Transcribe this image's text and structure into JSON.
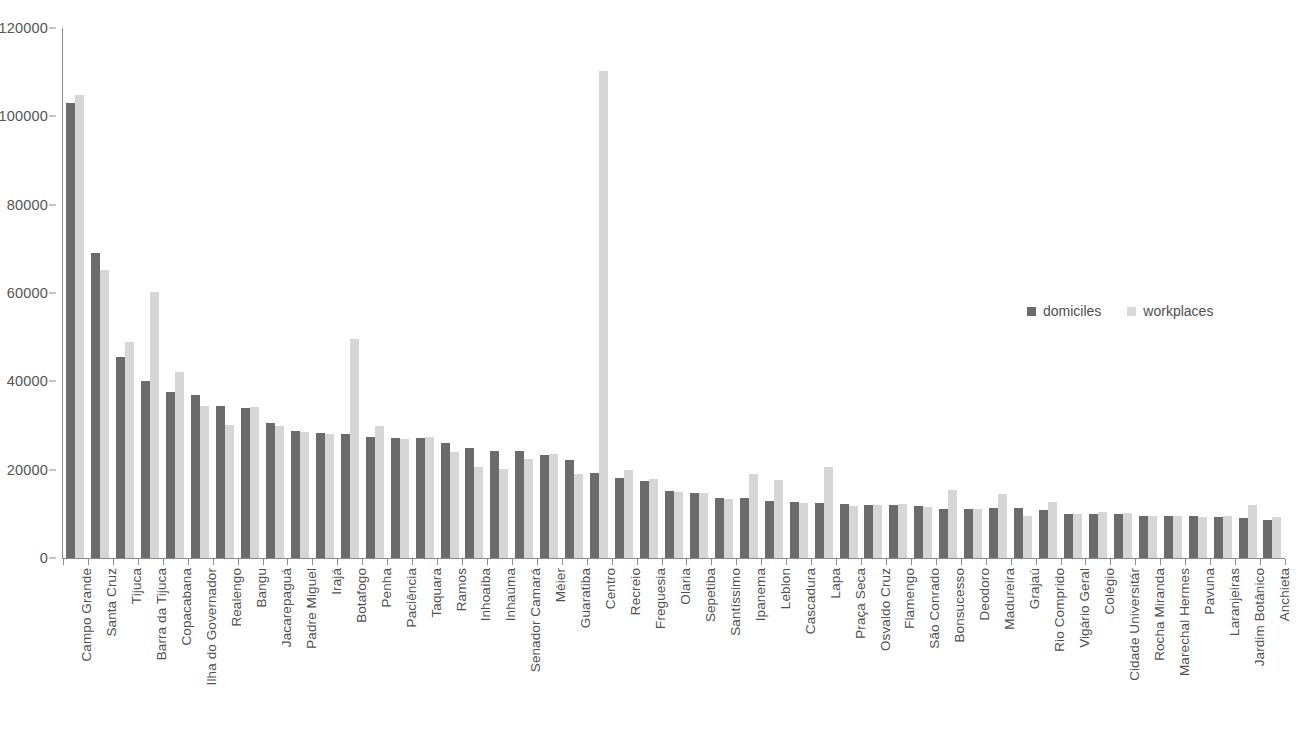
{
  "chart_data": {
    "type": "bar",
    "title": "",
    "subtitle": "",
    "xlabel": "",
    "ylabel": "",
    "ylim": [
      0,
      120000
    ],
    "ytick_step": 20000,
    "ytick_labels": [
      "0",
      "20000",
      "40000",
      "60000",
      "80000",
      "100000",
      "120000"
    ],
    "ytick_values": [
      0,
      20000,
      40000,
      60000,
      80000,
      100000,
      120000
    ],
    "grid": false,
    "legend_position": "inside-right",
    "orientation": "vertical",
    "bar_mode": "grouped",
    "colors": {
      "domiciles": "#6b6b6b",
      "workplaces": "#d6d6d6",
      "axis": "#8a8a8a",
      "text": "#4f4f4f",
      "background": "#ffffff"
    },
    "categories": [
      "Campo Grande",
      "Santa Cruz",
      "Tijuca",
      "Barra da Tijuca",
      "Copacabana",
      "Ilha do Governador",
      "Realengo",
      "Bangu",
      "Jacarepaguá",
      "Padre Miguel",
      "Irajá",
      "Botafogo",
      "Penha",
      "Paciência",
      "Taquara",
      "Ramos",
      "Inhoaíba",
      "Inhaúma",
      "Senador Camará",
      "Méier",
      "Guaratiba",
      "Centro",
      "Recreio",
      "Freguesia",
      "Olaria",
      "Sepetiba",
      "Santíssimo",
      "Ipanema",
      "Leblon",
      "Cascadura",
      "Lapa",
      "Praça Seca",
      "Osvaldo Cruz",
      "Flamengo",
      "São Conrado",
      "Bonsucesso",
      "Deodoro",
      "Madureira",
      "Grajaú",
      "Rio Comprido",
      "Vigário Geral",
      "Colégio",
      "Cidade Universitár",
      "Rocha Miranda",
      "Marechal Hermes",
      "Pavuna",
      "Laranjeiras",
      "Jardim Botânico",
      "Anchieta"
    ],
    "series": [
      {
        "name": "domiciles",
        "color": "#6b6b6b",
        "values": [
          103000,
          69000,
          45500,
          40000,
          37500,
          36800,
          34500,
          34000,
          30500,
          28800,
          28200,
          28000,
          27500,
          27200,
          27200,
          26000,
          24800,
          24300,
          24200,
          23300,
          22200,
          19200,
          18200,
          17500,
          15200,
          14700,
          13700,
          13500,
          12800,
          12700,
          12500,
          12200,
          12100,
          12000,
          11700,
          11200,
          11100,
          11300,
          11400,
          10800,
          10000,
          10000,
          9900,
          9500,
          9400,
          9400,
          9300,
          9000,
          8700
        ]
      },
      {
        "name": "workplaces",
        "color": "#d6d6d6",
        "values": [
          104800,
          65200,
          48800,
          60300,
          42200,
          34500,
          30200,
          34200,
          29800,
          28600,
          28000,
          49500,
          30000,
          27000,
          27500,
          24000,
          20600,
          20200,
          22500,
          23500,
          19000,
          110200,
          19900,
          17800,
          15000,
          14700,
          13400,
          19000,
          17700,
          12400,
          20500,
          11800,
          12000,
          12200,
          11500,
          15500,
          11000,
          14500,
          9400,
          12700,
          10000,
          10400,
          10100,
          9500,
          9400,
          9200,
          9600,
          12100,
          9200
        ]
      }
    ]
  },
  "legend": {
    "items": [
      {
        "label": "domiciles",
        "key": "domiciles"
      },
      {
        "label": "workplaces",
        "key": "workplaces"
      }
    ]
  }
}
